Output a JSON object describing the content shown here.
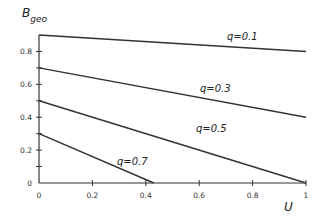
{
  "chart_data": {
    "type": "line",
    "title": "",
    "xlabel": "U",
    "ylabel": "B",
    "ylabel_subscript": "geo",
    "xlim": [
      0,
      1
    ],
    "ylim": [
      0,
      0.9
    ],
    "grid": false,
    "legend": "inline labels",
    "x_ticks": [
      "0",
      "0.2",
      "0.4",
      "0.6",
      "0.8",
      "1"
    ],
    "y_ticks": [
      "0",
      "0.2",
      "0.4",
      "0.6",
      "0.8"
    ],
    "series": [
      {
        "name": "q=0.1",
        "x": [
          0,
          1
        ],
        "values": [
          0.9,
          0.8
        ]
      },
      {
        "name": "q=0.3",
        "x": [
          0,
          1
        ],
        "values": [
          0.7,
          0.4
        ]
      },
      {
        "name": "q=0.5",
        "x": [
          0,
          1
        ],
        "values": [
          0.5,
          0.0
        ]
      },
      {
        "name": "q=0.7",
        "x": [
          0,
          0.43
        ],
        "values": [
          0.3,
          0.0
        ]
      }
    ]
  }
}
